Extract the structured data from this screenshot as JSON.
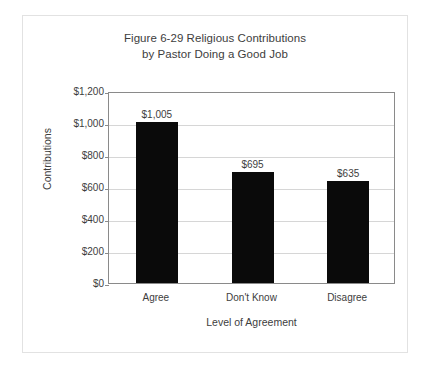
{
  "chart_data": {
    "type": "bar",
    "title": "Figure 6-29 Religious Contributions by Pastor Doing a Good Job",
    "title_lines": [
      "Figure 6-29 Religious Contributions",
      "by Pastor Doing a Good Job"
    ],
    "categories": [
      "Agree",
      "Don't Know",
      "Disagree"
    ],
    "values": [
      1005,
      695,
      635
    ],
    "value_labels": [
      "$1,005",
      "$695",
      "$635"
    ],
    "xlabel": "Level of Agreement",
    "ylabel": "Contributions",
    "ylim": [
      0,
      1200
    ],
    "ytick_values": [
      0,
      200,
      400,
      600,
      800,
      1000,
      1200
    ],
    "ytick_labels": [
      "$0",
      "$200",
      "$400",
      "$600",
      "$800",
      "$1,000",
      "$1,200"
    ],
    "grid": "horizontal",
    "legend": "none",
    "bar_color": "#0a0a0a",
    "gridline_color": "#d6d6d6",
    "axis_color": "#8a8a8a",
    "text_color": "#3d3d3d",
    "background_color": "#ffffff",
    "border_color": "#e2e2e2"
  }
}
